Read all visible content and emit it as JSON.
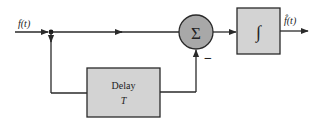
{
  "diagram": {
    "input_label": "f(t)",
    "output_label": "f̂(t)",
    "sum_symbol": "Σ",
    "sum_minus_sign": "−",
    "integrator_symbol": "∫",
    "delay_block": {
      "title": "Delay",
      "param": "T"
    }
  }
}
